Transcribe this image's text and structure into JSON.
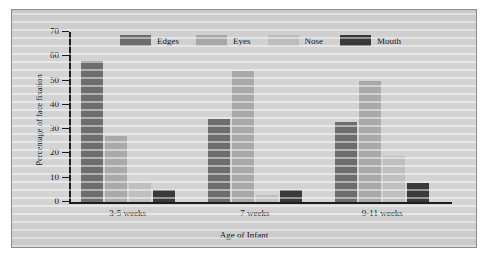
{
  "figure": {
    "panel_bg": "#d3d3d3",
    "border_color": "#8c8c8c"
  },
  "chart_data": {
    "type": "bar",
    "title": "",
    "xlabel": "Age of Infant",
    "ylabel": "Percentage of face fixation",
    "categories": [
      "3-5 weeks",
      "7 weeks",
      "9-11 weeks"
    ],
    "series": [
      {
        "name": "Edges",
        "color": "#6d6d6d",
        "values": [
          58,
          34,
          33
        ]
      },
      {
        "name": "Eyes",
        "color": "#a9a9a9",
        "values": [
          27,
          54,
          50
        ]
      },
      {
        "name": "Nose",
        "color": "#bfbfbf",
        "values": [
          8,
          3,
          19
        ]
      },
      {
        "name": "Mouth",
        "color": "#3a3a3a",
        "values": [
          5,
          5,
          8
        ]
      }
    ],
    "ylim": [
      0,
      70
    ],
    "yticks": [
      0,
      10,
      20,
      30,
      40,
      50,
      60,
      70
    ],
    "ytick_labels": [
      "0",
      "10",
      "20",
      "30",
      "40",
      "50",
      "60",
      "70"
    ],
    "grid": false,
    "legend_position": "top-center"
  },
  "axis": {
    "y_title": "Percentage of face fixation",
    "x_title": "Age of Infant"
  }
}
